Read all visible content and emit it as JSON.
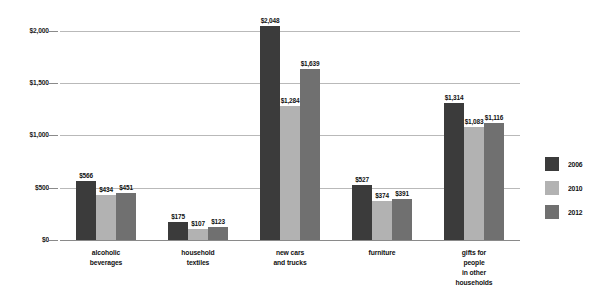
{
  "chart_data": {
    "type": "bar",
    "title": "",
    "subtitle": "",
    "xlabel": "",
    "ylabel": "",
    "ylim": [
      0,
      2200
    ],
    "grid": true,
    "legend_position": "right",
    "ytick_labels": [
      "$2,000",
      "$1,500",
      "$1,000",
      "$500",
      "$0"
    ],
    "ytick_values": [
      2000,
      1500,
      1000,
      500,
      0
    ],
    "categories": [
      [
        "alcoholic",
        "beverages"
      ],
      [
        "household",
        "textiles"
      ],
      [
        "new cars",
        "and trucks"
      ],
      [
        "furniture"
      ],
      [
        "gifts for",
        "people",
        "in other",
        "households"
      ]
    ],
    "series": [
      {
        "name": "2006",
        "color": "#3b3b3b",
        "values": [
          566,
          175,
          2048,
          527,
          1314
        ],
        "labels": [
          "$566",
          "$175",
          "$2,048",
          "$527",
          "$1,314"
        ]
      },
      {
        "name": "2010",
        "color": "#b2b2b2",
        "values": [
          434,
          107,
          1284,
          374,
          1083
        ],
        "labels": [
          "$434",
          "$107",
          "$1,284",
          "$374",
          "$1,083"
        ]
      },
      {
        "name": "2012",
        "color": "#707070",
        "values": [
          451,
          123,
          1639,
          391,
          1116
        ],
        "labels": [
          "$451",
          "$123",
          "$1,639",
          "$391",
          "$1,116"
        ]
      }
    ]
  },
  "colors": {
    "gridline": "#b9b9b9",
    "baseline": "#8a8a8a",
    "text": "#111111",
    "background": "#ffffff"
  }
}
